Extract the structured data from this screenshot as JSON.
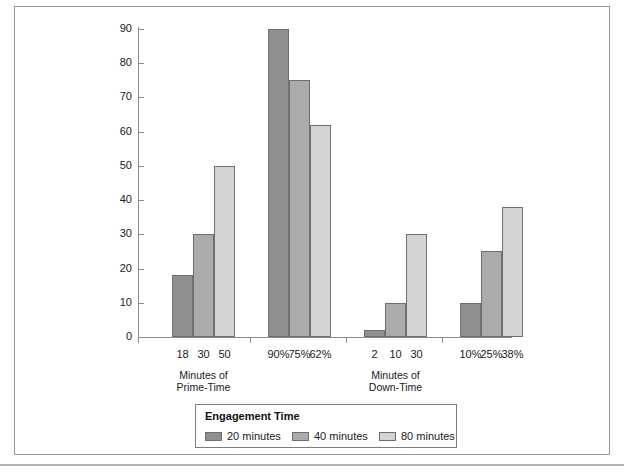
{
  "chart_data": {
    "type": "bar",
    "title": "",
    "xlabel": "",
    "ylabel": "",
    "ylim": [
      0,
      90
    ],
    "ytick_step": 10,
    "grid": false,
    "legend_position": "bottom-center",
    "legend_title": "Engagement Time",
    "groups": [
      {
        "group_label": "Minutes of\nPrime-Time",
        "tick_labels": [
          "18",
          "30",
          "50"
        ],
        "values": [
          18,
          30,
          50
        ]
      },
      {
        "group_label": "",
        "tick_labels": [
          "90%",
          "75%",
          "62%"
        ],
        "values": [
          90,
          75,
          62
        ]
      },
      {
        "group_label": "Minutes of\nDown-Time",
        "tick_labels": [
          "2",
          "10",
          "30"
        ],
        "values": [
          2,
          10,
          30
        ]
      },
      {
        "group_label": "",
        "tick_labels": [
          "10%",
          "25%",
          "38%"
        ],
        "values": [
          10,
          25,
          38
        ]
      }
    ],
    "series": [
      {
        "name": "20 minutes",
        "color": "#8f8f8f",
        "values": [
          18,
          90,
          2,
          10
        ]
      },
      {
        "name": "40 minutes",
        "color": "#ababab",
        "values": [
          30,
          75,
          10,
          25
        ]
      },
      {
        "name": "80 minutes",
        "color": "#d4d4d4",
        "values": [
          50,
          62,
          30,
          38
        ]
      }
    ],
    "ytick_labels": [
      "0",
      "10",
      "20",
      "30",
      "40",
      "50",
      "60",
      "70",
      "80",
      "90"
    ]
  },
  "legend": {
    "title": "Engagement Time",
    "entries": [
      {
        "label": "20 minutes",
        "color": "#8f8f8f"
      },
      {
        "label": "40 minutes",
        "color": "#ababab"
      },
      {
        "label": "80 minutes",
        "color": "#d4d4d4"
      }
    ]
  },
  "axis": {
    "y_ticks": [
      "90",
      "80",
      "70",
      "60",
      "50",
      "40",
      "30",
      "20",
      "10",
      "0"
    ],
    "category_labels": [
      "18",
      "30",
      "50",
      "90%",
      "75%",
      "62%",
      "2",
      "10",
      "30",
      "10%",
      "25%",
      "38%"
    ],
    "group_labels": [
      "Minutes of\nPrime-Time",
      "Minutes of\nDown-Time"
    ]
  }
}
